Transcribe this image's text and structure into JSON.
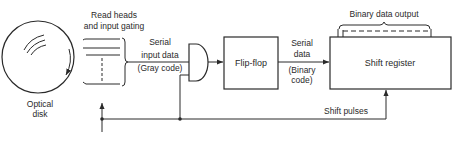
{
  "diagram": {
    "type": "block-diagram",
    "colors": {
      "line": "#2a2a2a",
      "background": "#ffffff"
    },
    "nodes": {
      "disk": {
        "label_line1": "Optical",
        "label_line2": "disk"
      },
      "read_heads": {
        "label_line1": "Read heads",
        "label_line2": "and input gating"
      },
      "gate": {
        "type": "AND"
      },
      "flip_flop": {
        "label": "Flip-flop"
      },
      "shift_register": {
        "label": "Shift register"
      }
    },
    "edges": {
      "serial_input": {
        "line1": "Serial",
        "line2": "input data",
        "line3": "(Gray code)"
      },
      "serial_data": {
        "line1": "Serial",
        "line2": "data",
        "line3": "(Binary",
        "line4": "code)"
      },
      "shift_pulses": {
        "label": "Shift pulses"
      },
      "binary_output": {
        "label": "Binary data output"
      }
    }
  }
}
